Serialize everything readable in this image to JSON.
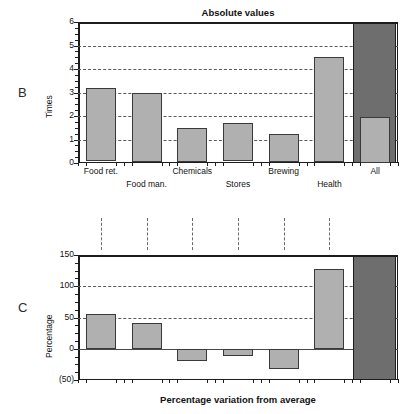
{
  "figure": {
    "panels": [
      {
        "letter": "B"
      },
      {
        "letter": "C"
      }
    ]
  },
  "chart_data": [
    {
      "type": "bar",
      "panel": "B",
      "title": "Absolute values",
      "xlabel": "",
      "ylabel": "Times",
      "ylim": [
        0,
        6
      ],
      "yticks": [
        0,
        1,
        2,
        3,
        4,
        5,
        6
      ],
      "ytick_labels": [
        "0",
        "1",
        "2",
        "3",
        "4",
        "5",
        "6"
      ],
      "yminor_step": 0.25,
      "grid": "horizontal-dashed",
      "gridlines": [
        1,
        2,
        3,
        4,
        5
      ],
      "legend": "none",
      "categories": [
        "Food ret.",
        "Food man.",
        "Chemicals",
        "Stores",
        "Brewing",
        "Health",
        "All"
      ],
      "values": [
        3.2,
        3.0,
        1.5,
        1.7,
        1.25,
        4.5,
        1.95
      ],
      "highlight_category": "All",
      "highlight_fill": "#6e6e6e",
      "bar_fill": "#b0b0b0",
      "bar_edge": "#3a3a3a"
    },
    {
      "type": "bar",
      "panel": "C",
      "title": "",
      "xlabel": "Percentage variation from average",
      "ylabel": "Percentage",
      "ylim": [
        -50,
        150
      ],
      "yticks": [
        -50,
        0,
        50,
        100,
        150
      ],
      "ytick_labels": [
        "(50)",
        "0",
        "50",
        "100",
        "150"
      ],
      "yminor_step": 12.5,
      "grid": "horizontal-dashed",
      "gridlines": [
        50,
        100
      ],
      "zero_line": 0,
      "legend": "none",
      "categories": [
        "Food ret.",
        "Food man.",
        "Chemicals",
        "Stores",
        "Brewing",
        "Health",
        "All"
      ],
      "values": [
        55,
        42,
        -20,
        -11,
        -32,
        128,
        0
      ],
      "highlight_category": "All",
      "highlight_fill": "#6e6e6e",
      "bar_fill": "#b0b0b0",
      "bar_edge": "#3a3a3a",
      "connector_lines": 6
    }
  ]
}
